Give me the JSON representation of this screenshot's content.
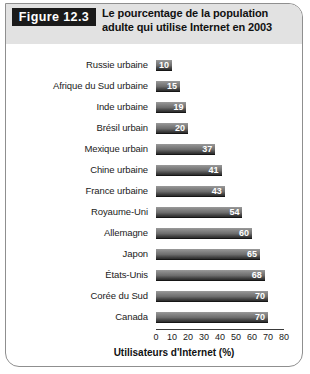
{
  "figure": {
    "badge": "Figure 12.3",
    "title_line1": "Le pourcentage de la population",
    "title_line2": "adulte qui utilise Internet en 2003",
    "badge_bg": "#1a1a1a",
    "badge_fg": "#ffffff",
    "header_bg": "#e2e2e2",
    "border_color": "#8f8f8f"
  },
  "chart_data": {
    "type": "bar",
    "orientation": "horizontal",
    "title": "Le pourcentage de la population adulte qui utilise Internet en 2003",
    "categories": [
      "Russie urbaine",
      "Afrique du Sud urbaine",
      "Inde urbaine",
      "Brésil urbain",
      "Mexique urbain",
      "Chine urbaine",
      "France urbaine",
      "Royaume-Uni",
      "Allemagne",
      "Japon",
      "États-Unis",
      "Corée du Sud",
      "Canada"
    ],
    "values": [
      10,
      15,
      19,
      20,
      37,
      41,
      43,
      54,
      60,
      65,
      68,
      70,
      70
    ],
    "xlabel": "Utilisateurs d'Internet (%)",
    "ylabel": "",
    "xlim": [
      0,
      80
    ],
    "xticks": [
      0,
      10,
      20,
      30,
      40,
      50,
      60,
      70,
      80
    ],
    "xtick_labels": [
      "0",
      "10",
      "20",
      "30",
      "40",
      "50",
      "60",
      "70",
      "80"
    ],
    "grid": false,
    "legend": null,
    "bar_color": "#6d6d6d",
    "value_label_color": "#ffffff"
  }
}
